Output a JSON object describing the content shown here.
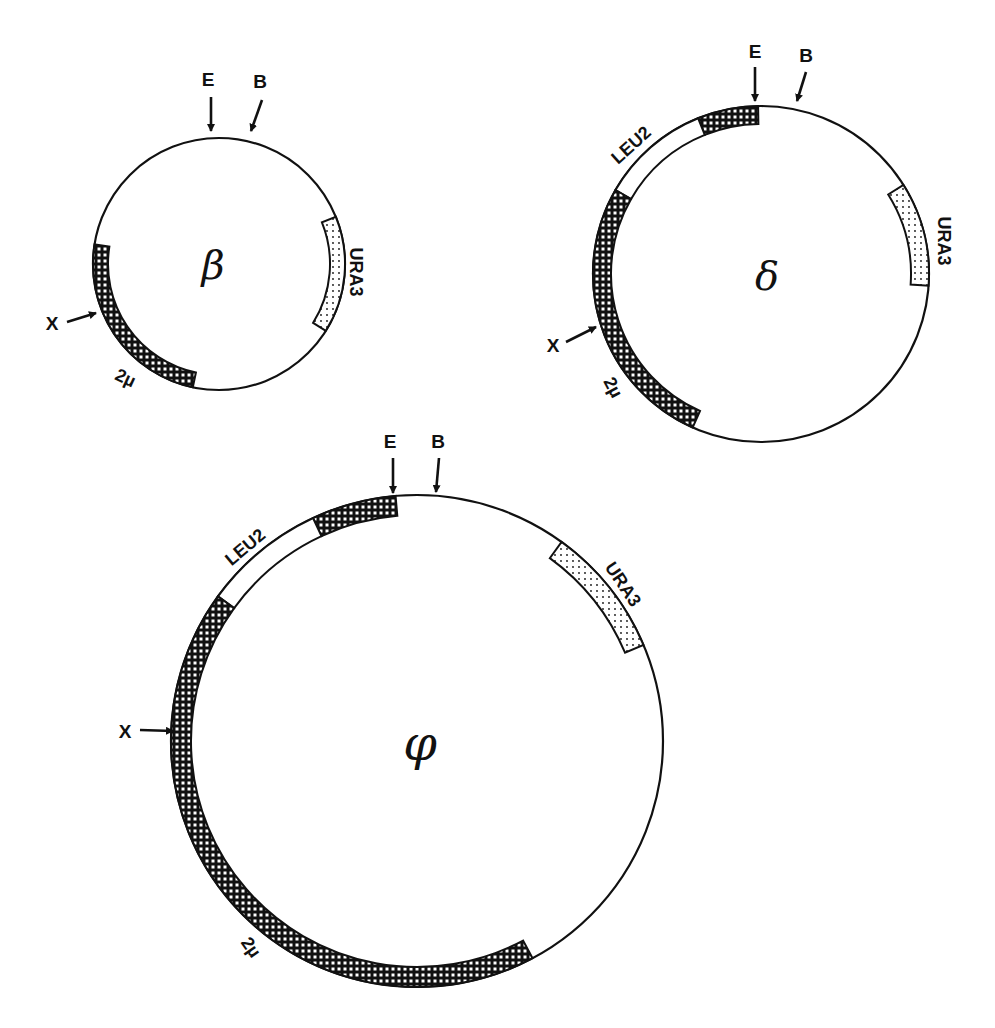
{
  "figure": {
    "type": "plasmid-maps",
    "colors": {
      "line": "#111111",
      "background": "#ffffff",
      "crosshatch_fill": "#111111",
      "stipple_fill": "#ffffff"
    },
    "legend_segments": {
      "crosshatch": "2µ",
      "white": "LEU2",
      "stipple": "URA3"
    },
    "plasmids": [
      {
        "id": "beta",
        "name": "β",
        "center": [
          219,
          264
        ],
        "radius": 126,
        "band_width": 15,
        "name_pos": [
          213,
          279
        ],
        "name_size": 40,
        "segments": [
          {
            "label": "2µ",
            "pattern": "crosshatch",
            "start": 102,
            "end": 189
          },
          {
            "label": "URA3",
            "pattern": "stipple",
            "start": -22,
            "end": 32
          }
        ],
        "sites": [
          {
            "label": "E",
            "label_pos": [
              208,
              86
            ],
            "from": [
              211,
              97
            ],
            "to": [
              211,
              131
            ]
          },
          {
            "label": "B",
            "label_pos": [
              260,
              88
            ],
            "from": [
              262,
              100
            ],
            "to": [
              251,
              131
            ]
          },
          {
            "label": "X",
            "label_pos": [
              52,
              330
            ],
            "from": [
              67,
              322
            ],
            "to": [
              96,
              313
            ]
          }
        ],
        "labels": [
          {
            "text": "URA3",
            "pos": [
              355,
              272
            ],
            "rotate": 90
          },
          {
            "text": "2µ",
            "pos": [
              125,
              379
            ],
            "rotate": 25
          }
        ]
      },
      {
        "id": "delta",
        "name": "δ",
        "center": [
          761,
          274
        ],
        "radius": 168,
        "band_width": 18,
        "name_pos": [
          767,
          290
        ],
        "name_size": 40,
        "segments": [
          {
            "label": "2µ",
            "pattern": "crosshatch",
            "start": -112,
            "end": -91
          },
          {
            "label": "LEU2",
            "pattern": "white",
            "start": -150,
            "end": -112
          },
          {
            "label": "2µ",
            "pattern": "crosshatch",
            "start": 114,
            "end": 210
          },
          {
            "label": "URA3",
            "pattern": "stipple",
            "start": -32,
            "end": 4
          }
        ],
        "sites": [
          {
            "label": "E",
            "label_pos": [
              755,
              58
            ],
            "from": [
              755,
              67
            ],
            "to": [
              755,
              101
            ]
          },
          {
            "label": "B",
            "label_pos": [
              806,
              62
            ],
            "from": [
              806,
              72
            ],
            "to": [
              797,
              101
            ]
          },
          {
            "label": "X",
            "label_pos": [
              553,
              352
            ],
            "from": [
              566,
              342
            ],
            "to": [
              596,
              327
            ]
          }
        ],
        "labels": [
          {
            "text": "LEU2",
            "pos": [
              632,
              146
            ],
            "rotate": -42
          },
          {
            "text": "URA3",
            "pos": [
              943,
              241
            ],
            "rotate": 90
          },
          {
            "text": "2µ",
            "pos": [
              612,
              388
            ],
            "rotate": 62
          }
        ]
      },
      {
        "id": "phi",
        "name": "φ",
        "center": [
          417,
          741
        ],
        "radius": 246,
        "band_width": 20,
        "name_pos": [
          420,
          760
        ],
        "name_size": 48,
        "segments": [
          {
            "label": "2µ",
            "pattern": "crosshatch",
            "start": -115,
            "end": -95
          },
          {
            "label": "LEU2",
            "pattern": "white",
            "start": -144,
            "end": -115
          },
          {
            "label": "2µ",
            "pattern": "crosshatch",
            "start": 62,
            "end": 216
          },
          {
            "label": "URA3",
            "pattern": "stipple",
            "start": -54,
            "end": -23
          }
        ],
        "sites": [
          {
            "label": "E",
            "label_pos": [
              390,
              448
            ],
            "from": [
              393,
              458
            ],
            "to": [
              393,
              493
            ]
          },
          {
            "label": "B",
            "label_pos": [
              438,
              448
            ],
            "from": [
              439,
              458
            ],
            "to": [
              436,
              492
            ]
          },
          {
            "label": "X",
            "label_pos": [
              125,
              738
            ],
            "from": [
              140,
              730
            ],
            "to": [
              173,
              731
            ]
          }
        ],
        "labels": [
          {
            "text": "LEU2",
            "pos": [
              246,
              548
            ],
            "rotate": -40
          },
          {
            "text": "URA3",
            "pos": [
              622,
              585
            ],
            "rotate": 56
          },
          {
            "text": "2µ",
            "pos": [
              250,
              948
            ],
            "rotate": 55
          }
        ]
      }
    ]
  }
}
